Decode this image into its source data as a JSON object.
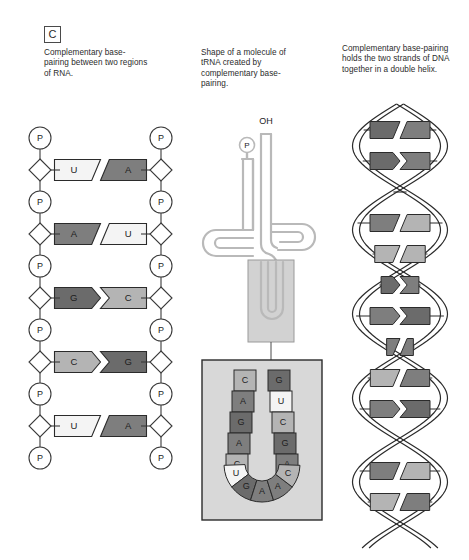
{
  "panel": {
    "label": "C",
    "captions": [
      "Complementary base-pairing between two regions of RNA.",
      "Shape of a molecule of tRNA created by complementary base-pairing.",
      "Complementary base-pairing holds the two strands of DNA together in a double helix."
    ]
  },
  "colors": {
    "base_A": "#7e7e7e",
    "base_G": "#6b6b6b",
    "base_C": "#b4b4b4",
    "base_U": "#f4f4f4",
    "outline": "#2b2b2b",
    "backbone": "#3a3a3a",
    "trna_strand": "#b9b9b9",
    "trna_box_fill": "#d2d2d2",
    "magnify_fill": "#d8d8d8",
    "helix_line": "#2b2b2b"
  },
  "rna_ladder": {
    "name": "RNA complementary base-pairing ladder",
    "backbone_node_label": "P",
    "phosphate_count_per_strand": 6,
    "rungs": [
      {
        "left": "U",
        "right": "A",
        "joint": "slant"
      },
      {
        "left": "A",
        "right": "U",
        "joint": "slant"
      },
      {
        "left": "G",
        "right": "C",
        "joint": "arrow"
      },
      {
        "left": "C",
        "right": "G",
        "joint": "arrow"
      },
      {
        "left": "U",
        "right": "A",
        "joint": "slant"
      }
    ]
  },
  "trna": {
    "name": "tRNA cloverleaf",
    "terminal_label": "OH",
    "phosphate_label": "P",
    "anticodon_stem_left": [
      "C",
      "A",
      "G",
      "A",
      "C"
    ],
    "anticodon_stem_right": [
      "G",
      "U",
      "C",
      "G",
      "A"
    ],
    "anticodon_loop": [
      "U",
      "G",
      "A",
      "A",
      "C"
    ]
  },
  "dna_helix": {
    "name": "DNA double helix",
    "rungs": [
      {
        "left": "dark",
        "right": "mid",
        "joint": "slant"
      },
      {
        "left": "dark",
        "right": "mid",
        "joint": "arrow"
      },
      {
        "left": "mid",
        "right": "dark",
        "joint": "arrow"
      },
      {
        "left": "mid",
        "right": "light",
        "joint": "slant"
      },
      {
        "left": "light",
        "right": "light",
        "joint": "slant"
      },
      {
        "left": "dark",
        "right": "mid",
        "joint": "arrow"
      },
      {
        "left": "mid",
        "right": "dark",
        "joint": "arrow"
      },
      {
        "left": "mid",
        "right": "mid",
        "joint": "slant"
      },
      {
        "left": "light",
        "right": "mid",
        "joint": "slant"
      },
      {
        "left": "mid",
        "right": "dark",
        "joint": "arrow"
      },
      {
        "left": "light",
        "right": "dark",
        "joint": "arrow"
      },
      {
        "left": "mid",
        "right": "light",
        "joint": "slant"
      },
      {
        "left": "light",
        "right": "mid",
        "joint": "slant"
      }
    ]
  }
}
